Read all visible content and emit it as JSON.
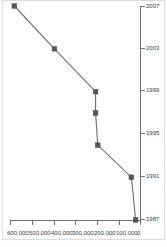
{
  "chart_data": {
    "type": "line",
    "title": "",
    "subtitle": "",
    "xlabel": "",
    "ylabel": "",
    "orientation": "rotated-90-ccw",
    "grid": false,
    "legend": null,
    "x": [
      1987,
      1991,
      1994,
      1997,
      1999,
      2003,
      2007
    ],
    "xlim": [
      1987,
      2007
    ],
    "ylim": [
      0,
      600000
    ],
    "x_tick_labels": [
      "1987",
      "1991",
      "1995",
      "1999",
      "2003",
      "2007"
    ],
    "x_tick_values": [
      1987,
      1991,
      1995,
      1999,
      2003,
      2007
    ],
    "y_tick_labels": [
      "0",
      "100,000",
      "200,000",
      "300,000",
      "400,000",
      "500,000",
      "600,000"
    ],
    "y_tick_values": [
      0,
      100000,
      200000,
      300000,
      400000,
      500000,
      600000
    ],
    "series": [
      {
        "name": "",
        "values": [
          20000,
          40000,
          195000,
          205000,
          205000,
          395000,
          580000
        ],
        "marker": "square",
        "color": "#575757"
      }
    ]
  },
  "axis": {
    "year_labels": {
      "t0": "1987",
      "t1": "1991",
      "t2": "1995",
      "t3": "1999",
      "t4": "2003",
      "t5": "2007"
    },
    "value_labels": {
      "v0": "0",
      "v1": "100,000",
      "v2": "200,000",
      "v3": "300,000",
      "v4": "400,000",
      "v5": "500,000",
      "v6": "600,000"
    }
  },
  "colors": {
    "line": "#6b6b6b",
    "marker": "#575757",
    "axis": "#6e6e6e",
    "text": "#3a3a3a",
    "background": "#ffffff",
    "frame": "#dcdcdc"
  }
}
